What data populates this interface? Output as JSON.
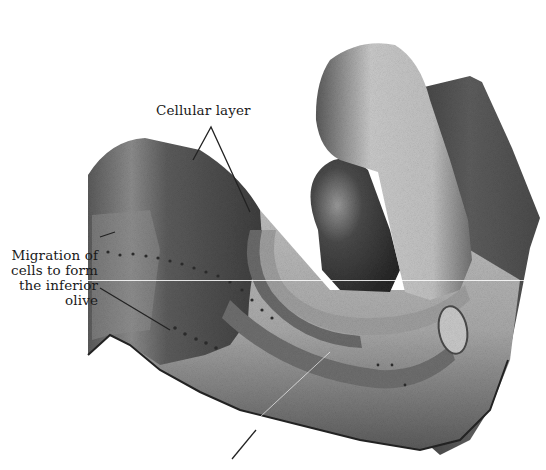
{
  "figure": {
    "labels": {
      "cellular_layer": "Cellular layer",
      "migration": {
        "line1": "Migration of",
        "line2": "cells to form",
        "line3": "the inferior",
        "line4": "olive"
      }
    },
    "colors": {
      "background": "#ffffff",
      "text": "#1a1a1a",
      "dark_tissue": "#4a4a4a",
      "mid_tissue": "#7a7a7a",
      "light_tissue": "#b8b8b8",
      "highlight_tissue": "#d4d4d4"
    }
  }
}
